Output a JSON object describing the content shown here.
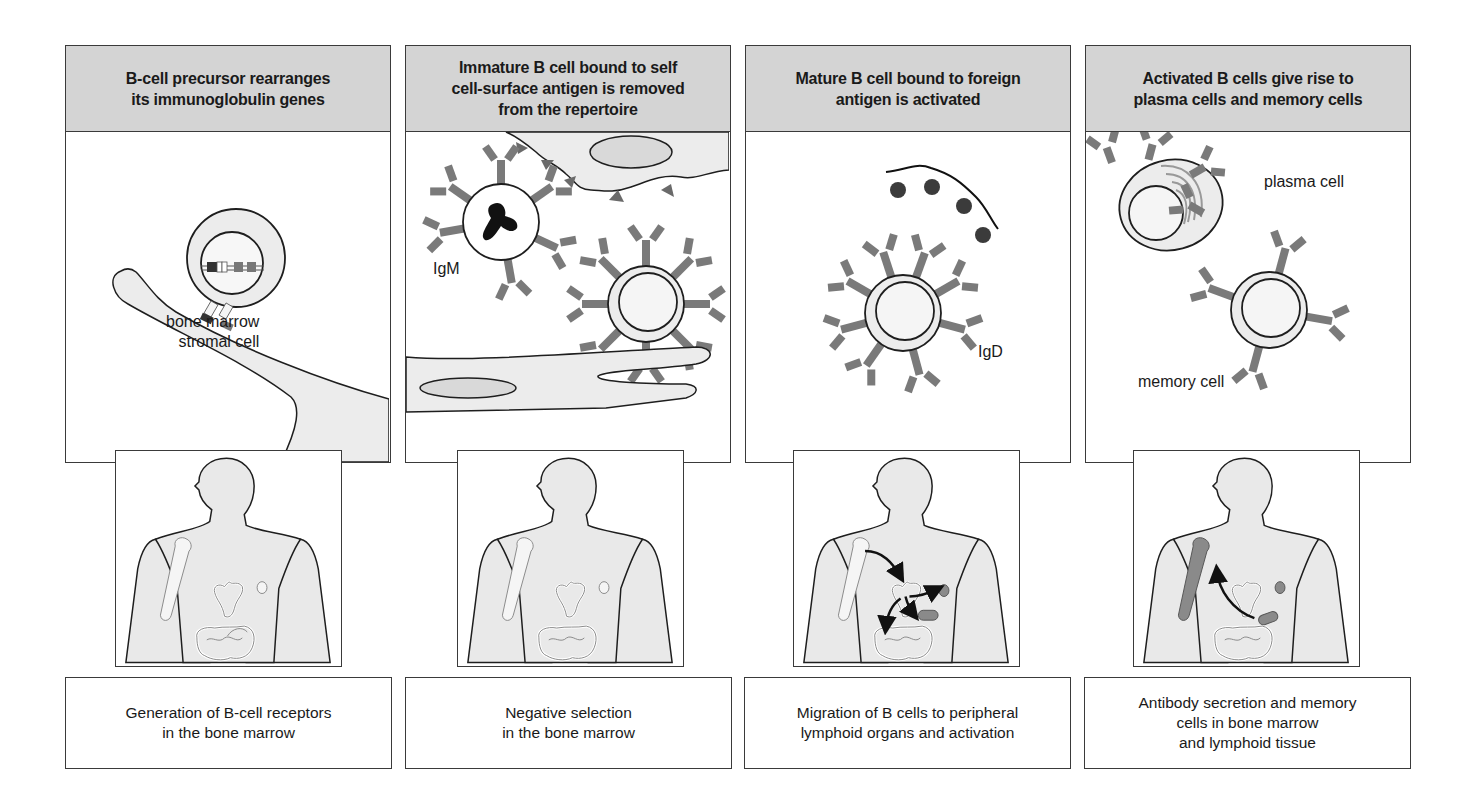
{
  "figure": {
    "panels": [
      {
        "header": "B-cell precursor rearranges\nits immunoglobulin genes",
        "labels": [
          "bone marrow\nstromal cell"
        ],
        "caption": "Generation of B-cell receptors\nin the bone marrow"
      },
      {
        "header": "Immature B cell bound to self\ncell-surface antigen is removed\nfrom the repertoire",
        "labels": [
          "IgM"
        ],
        "caption": "Negative selection\nin the bone marrow"
      },
      {
        "header": "Mature B cell bound to foreign\nantigen is activated",
        "labels": [
          "IgD"
        ],
        "caption": "Migration of B cells to peripheral\nlymphoid organs and activation"
      },
      {
        "header": "Activated B cells give rise to\nplasma cells and memory cells",
        "labels": [
          "plasma cell",
          "memory cell"
        ],
        "caption": "Antibody secretion and memory\ncells in bone marrow\nand lymphoid tissue"
      }
    ],
    "colors": {
      "header_fill": "#d4d4d4",
      "cell_fill": "#ececec",
      "receptor_fill": "#7a7a7a",
      "dark_antigen": "#3b3b3b",
      "outline": "#1e1e1e",
      "highlight_organ": "#8a8a8a"
    }
  }
}
